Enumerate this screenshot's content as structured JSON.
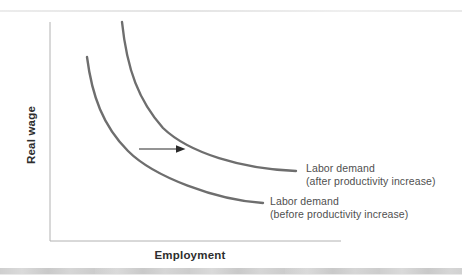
{
  "chart_data": {
    "type": "line",
    "title": "",
    "xlabel": "Employment",
    "ylabel": "Real wage",
    "x_axis": {
      "label": "Employment",
      "ticks": [],
      "quantitative": false
    },
    "y_axis": {
      "label": "Real wage",
      "ticks": [],
      "quantitative": false
    },
    "legend_position": "inline-right-of-curves",
    "grid": false,
    "series": [
      {
        "name": "Labor demand (before productivity increase)",
        "label_lines": [
          "Labor demand",
          "(before productivity increase)"
        ],
        "shape": "downward-sloping convex demand curve",
        "svg_path": "M 87 57 C 92 96, 103 126, 128 151 C 154 177, 216 200, 263 203",
        "points_px": [
          [
            87,
            57
          ],
          [
            93,
            90
          ],
          [
            113,
            115
          ],
          [
            137,
            148
          ],
          [
            163,
            172
          ],
          [
            200,
            190
          ],
          [
            240,
            202
          ],
          [
            263,
            203
          ]
        ],
        "color": "#6e6e6e",
        "label_anchor_px": [
          270,
          205
        ]
      },
      {
        "name": "Labor demand (after productivity increase)",
        "label_lines": [
          "Labor demand",
          "(after productivity increase)"
        ],
        "shape": "downward-sloping convex demand curve shifted right",
        "svg_path": "M 122 22 C 127 70, 139 101, 163 128 C 189 153, 242 169, 296 171",
        "points_px": [
          [
            122,
            22
          ],
          [
            138,
            90
          ],
          [
            160,
            115
          ],
          [
            183,
            133
          ],
          [
            210,
            153
          ],
          [
            240,
            167
          ],
          [
            296,
            171
          ]
        ],
        "color": "#6e6e6e",
        "label_anchor_px": [
          306,
          172
        ]
      }
    ],
    "arrow": {
      "name": "rightward-shift-arrow",
      "shaft_path": "M 139 149 L 176 149",
      "head_points": "176,145.3 185.5,149 176,152.7",
      "color": "#2b2b2b"
    },
    "axes_px": {
      "y_axis_path": "M 50 22 L 50 241",
      "x_axis_path": "M 50 241 L 341 241"
    }
  },
  "labels": {
    "after_line1": "Labor demand",
    "after_line2": "(after productivity increase)",
    "before_line1": "Labor demand",
    "before_line2": "(before productivity increase)"
  },
  "colors": {
    "background": "#ffffff",
    "curve": "#6e6e6e",
    "axis": "#b2b2b2",
    "curve_label_text": "#4f4f4f",
    "axis_label_text": "#2e2e2e",
    "arrow": "#2b2b2b",
    "top_rule": "#e8e8e8",
    "bottom_band": "#cfcfcf"
  }
}
